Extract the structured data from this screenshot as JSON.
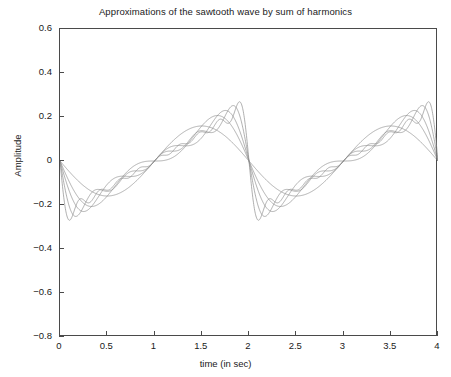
{
  "chart_data": {
    "type": "line",
    "title": "Approximations of the sawtooth wave by sum of harmonics",
    "xlabel": "time (in sec)",
    "ylabel": "Amplitude",
    "xlim": [
      0,
      4
    ],
    "ylim": [
      -0.8,
      0.6
    ],
    "xticks": [
      "0",
      "0.5",
      "1",
      "1.5",
      "2",
      "2.5",
      "3",
      "3.5",
      "4"
    ],
    "xtick_values": [
      0,
      0.5,
      1,
      1.5,
      2,
      2.5,
      3,
      3.5,
      4
    ],
    "yticks": [
      "0.6",
      "0.4",
      "0.2",
      "0",
      "−0.2",
      "−0.4",
      "−0.6",
      "−0.8"
    ],
    "ytick_values": [
      0.6,
      0.4,
      0.2,
      0,
      -0.2,
      -0.4,
      -0.6,
      -0.8
    ],
    "grid": false,
    "legend": "none",
    "line_color": "#8c8c8c",
    "axis_color": "#4a4a4a",
    "background": "#ffffff",
    "waveform": "sawtooth",
    "period_sec": 2,
    "amplitude": 0.5,
    "fourier_formula": "x(t) = -(A/pi) * sum_{k=1..N} (1/k) * sin(2*pi*k*t/T)",
    "series": [
      {
        "name": "N = 1 harmonic",
        "harmonics": 1,
        "peak": 0.318,
        "trough": -0.318
      },
      {
        "name": "N = 2 harmonics",
        "harmonics": 2,
        "peak": 0.424,
        "trough": -0.424
      },
      {
        "name": "N = 3 harmonics",
        "harmonics": 3,
        "peak": 0.462,
        "trough": -0.462
      },
      {
        "name": "N = 5 harmonics",
        "harmonics": 5,
        "peak": 0.497,
        "trough": -0.497
      },
      {
        "name": "N = 9 harmonics",
        "harmonics": 9,
        "peak": 0.525,
        "trough": -0.525
      }
    ],
    "discontinuities_at": [
      0,
      2,
      4
    ]
  }
}
